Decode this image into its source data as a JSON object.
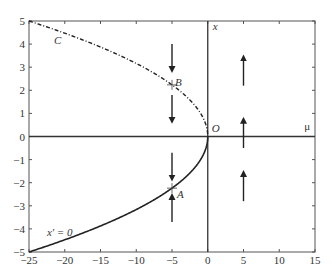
{
  "chart_data": {
    "type": "line",
    "title": "",
    "xlabel": "μ",
    "ylabel": "x",
    "xlim": [
      -25,
      15
    ],
    "ylim": [
      -5,
      5
    ],
    "grid": false,
    "x_ticks": [
      -25,
      -20,
      -15,
      -10,
      -5,
      0,
      5,
      10,
      15
    ],
    "y_ticks": [
      -5,
      -4,
      -3,
      -2,
      -1,
      0,
      1,
      2,
      3,
      4,
      5
    ],
    "x_tick_labels": [
      "−25",
      "−20",
      "−15",
      "−10",
      "−5",
      "0",
      "5",
      "10",
      "15"
    ],
    "y_tick_labels": [
      "−5",
      "−4",
      "−3",
      "−2",
      "−1",
      "0",
      "1",
      "2",
      "3",
      "4",
      "5"
    ],
    "series": [
      {
        "name": "C (upper branch, x = +sqrt(-μ))",
        "style": "dash-dot",
        "x": [
          -25,
          -20,
          -15,
          -10,
          -5,
          -2,
          -1,
          -0.25,
          0
        ],
        "y": [
          5,
          4.472,
          3.873,
          3.162,
          2.236,
          1.414,
          1.0,
          0.5,
          0
        ]
      },
      {
        "name": "x' = 0 (lower branch, x = -sqrt(-μ))",
        "style": "solid",
        "x": [
          -25,
          -20,
          -15,
          -10,
          -5,
          -2,
          -1,
          -0.25,
          0
        ],
        "y": [
          -5,
          -4.472,
          -3.873,
          -3.162,
          -2.236,
          -1.414,
          -1.0,
          -0.5,
          0
        ]
      }
    ],
    "points": [
      {
        "label": "A",
        "x": -5,
        "y": -2.236
      },
      {
        "label": "B",
        "x": -5,
        "y": 2.236
      },
      {
        "label": "O",
        "x": 0,
        "y": 0
      }
    ],
    "annotations": [
      {
        "text": "C",
        "x": -21.5,
        "y": 4.0
      },
      {
        "text": "x' = 0",
        "x": -22.5,
        "y": -4.3
      },
      {
        "text": "x",
        "x": 0.7,
        "y": 4.6
      },
      {
        "text": "μ",
        "x": 13.5,
        "y": 0.3
      }
    ],
    "flow_arrows": [
      {
        "x": -5,
        "from": 4.0,
        "to": 2.9,
        "direction": "down"
      },
      {
        "x": -5,
        "from": 1.8,
        "to": 0.7,
        "direction": "down"
      },
      {
        "x": -5,
        "from": -0.7,
        "to": -1.8,
        "direction": "down"
      },
      {
        "x": -5,
        "from": -3.7,
        "to": -2.6,
        "direction": "up"
      },
      {
        "x": 5,
        "from": 2.2,
        "to": 3.4,
        "direction": "up"
      },
      {
        "x": 5,
        "from": -0.5,
        "to": 0.7,
        "direction": "up"
      },
      {
        "x": 5,
        "from": -2.8,
        "to": -1.6,
        "direction": "up"
      }
    ]
  }
}
